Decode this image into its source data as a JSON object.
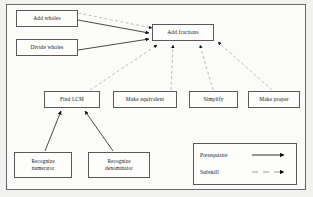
{
  "diagram": {
    "colors": {
      "page_background": "#f2f2f0",
      "frame_background": "#fbfbfa",
      "frame_border": "#6b6b6b",
      "node_border": "#5a5a5a",
      "node_background": "#fdfdfc",
      "text": "#151515",
      "prerequisite_line": "#1a1a1a",
      "subskill_line": "#9a9a9a"
    },
    "nodes": [
      {
        "id": "add-wholes",
        "label": "Add wholes",
        "label_line2": "",
        "x": 16,
        "y": 10,
        "w": 62,
        "h": 17
      },
      {
        "id": "divide-wholes",
        "label": "Divide wholes",
        "label_line2": "",
        "x": 16,
        "y": 39,
        "w": 62,
        "h": 17
      },
      {
        "id": "add-fractions",
        "label": "Add fractions",
        "label_line2": "",
        "x": 152,
        "y": 24,
        "w": 62,
        "h": 17
      },
      {
        "id": "find-lcm",
        "label": "Find LCM",
        "label_line2": "",
        "x": 44,
        "y": 91,
        "w": 56,
        "h": 17
      },
      {
        "id": "make-equivalent",
        "label": "Make equivalent",
        "label_line2": "",
        "x": 113,
        "y": 91,
        "w": 64,
        "h": 17
      },
      {
        "id": "simplify",
        "label": "Simplify",
        "label_line2": "",
        "x": 189,
        "y": 91,
        "w": 49,
        "h": 17
      },
      {
        "id": "make-proper",
        "label": "Make proper",
        "label_line2": "",
        "x": 248,
        "y": 91,
        "w": 52,
        "h": 17
      },
      {
        "id": "recognize-numerator",
        "label": "Recognize",
        "label_line2": "numerator",
        "x": 14,
        "y": 152,
        "w": 58,
        "h": 26
      },
      {
        "id": "recognize-denominator",
        "label": "Recognize",
        "label_line2": "denominator",
        "x": 88,
        "y": 152,
        "w": 62,
        "h": 26
      }
    ],
    "edges": [
      {
        "from": "add-wholes",
        "to": "add-fractions",
        "type": "prerequisite"
      },
      {
        "from": "divide-wholes",
        "to": "add-fractions",
        "type": "prerequisite"
      },
      {
        "from": "recognize-numerator",
        "to": "find-lcm",
        "type": "prerequisite"
      },
      {
        "from": "recognize-denominator",
        "to": "find-lcm",
        "type": "prerequisite"
      },
      {
        "from": "add-wholes",
        "to": "add-fractions",
        "type": "subskill"
      },
      {
        "from": "find-lcm",
        "to": "add-fractions",
        "type": "subskill"
      },
      {
        "from": "make-equivalent",
        "to": "add-fractions",
        "type": "subskill"
      },
      {
        "from": "simplify",
        "to": "add-fractions",
        "type": "subskill"
      },
      {
        "from": "make-proper",
        "to": "add-fractions",
        "type": "subskill"
      }
    ]
  },
  "legend": {
    "prerequisite_label": "Prerequisite",
    "subskill_label": "Subskill"
  }
}
